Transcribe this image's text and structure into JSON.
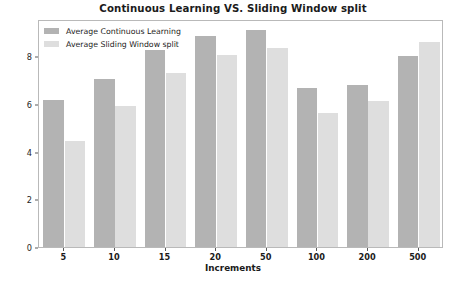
{
  "chart_data": {
    "type": "bar",
    "title": "Continuous Learning VS. Sliding Window split",
    "xlabel": "Increments",
    "ylabel": "MAE",
    "categories": [
      "5",
      "10",
      "15",
      "20",
      "50",
      "100",
      "200",
      "500"
    ],
    "series": [
      {
        "name": "Average Continuous Learning",
        "color": "#b3b3b3",
        "values": [
          6.15,
          7.05,
          8.25,
          8.85,
          9.1,
          6.65,
          6.8,
          8.0
        ]
      },
      {
        "name": "Average Sliding Window split",
        "color": "#dedede",
        "values": [
          4.45,
          5.9,
          7.3,
          8.05,
          8.35,
          5.6,
          6.1,
          8.6
        ]
      }
    ],
    "ylim": [
      0,
      9.55
    ],
    "yticks": [
      0,
      2,
      4,
      6,
      8
    ],
    "ytick_labels": [
      "0",
      "2",
      "4",
      "6",
      "8"
    ],
    "grid": false,
    "legend_position": "upper-left"
  },
  "legend": {
    "entries": [
      {
        "label": "Average Continuous Learning"
      },
      {
        "label": "Average Sliding Window split"
      }
    ]
  }
}
